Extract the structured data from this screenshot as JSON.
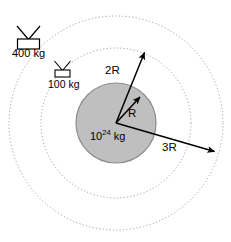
{
  "diagram": {
    "type": "physics-orbital-diagram",
    "background_color": "#ffffff",
    "planet": {
      "label_base": "10",
      "label_exponent": "24",
      "label_unit": " kg",
      "fill_color": "#bfbfbf",
      "stroke_color": "#808080",
      "center": {
        "x": 116,
        "y": 123
      },
      "radius": 40
    },
    "orbits": [
      {
        "name": "inner-orbit",
        "radius_label": "2R",
        "radius_px": 75,
        "style": "dotted"
      },
      {
        "name": "outer-orbit",
        "radius_label": "3R",
        "radius_px": 107,
        "style": "dotted"
      }
    ],
    "radius_arrows": [
      {
        "name": "radius-r-arrow",
        "label": "R",
        "tip": {
          "x": 141,
          "y": 96
        }
      },
      {
        "name": "radius-2r-arrow",
        "label": "2R",
        "tip": {
          "x": 145,
          "y": 51
        }
      },
      {
        "name": "radius-3r-arrow",
        "label": "3R",
        "tip": {
          "x": 216,
          "y": 152
        }
      }
    ],
    "satellites": [
      {
        "name": "satellite-400kg",
        "label": "400 kg",
        "mass": "400 kg",
        "size": "large"
      },
      {
        "name": "satellite-100kg",
        "label": "100 kg",
        "mass": "100 kg",
        "size": "small"
      }
    ],
    "colors": {
      "line": "#000000",
      "dotted": "#9a9a9a",
      "planet_fill": "#bfbfbf",
      "planet_stroke": "#8c8c8c"
    }
  }
}
